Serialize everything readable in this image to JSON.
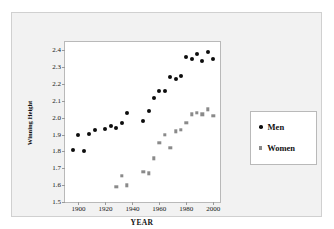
{
  "chart_data": {
    "type": "scatter",
    "title": "",
    "xlabel": "YEAR",
    "ylabel": "Winning Height",
    "xlim": [
      1890,
      2005
    ],
    "ylim": [
      1.5,
      2.45
    ],
    "xticks": [
      1900,
      1920,
      1940,
      1960,
      1980,
      2000
    ],
    "yticks": [
      "1.5",
      "1.6",
      "1.7",
      "1.8",
      "1.9",
      "2.0",
      "2.1",
      "2.2",
      "2.3",
      "2.4"
    ],
    "grid": false,
    "legend_position": "right",
    "series": [
      {
        "name": "Men",
        "marker": "circle",
        "color": "#0d0d0d",
        "points": [
          [
            1896,
            1.81
          ],
          [
            1900,
            1.9
          ],
          [
            1904,
            1.8
          ],
          [
            1908,
            1.905
          ],
          [
            1912,
            1.93
          ],
          [
            1920,
            1.935
          ],
          [
            1924,
            1.95
          ],
          [
            1928,
            1.94
          ],
          [
            1932,
            1.97
          ],
          [
            1936,
            2.03
          ],
          [
            1948,
            1.98
          ],
          [
            1952,
            2.04
          ],
          [
            1956,
            2.12
          ],
          [
            1960,
            2.16
          ],
          [
            1964,
            2.16
          ],
          [
            1968,
            2.24
          ],
          [
            1972,
            2.23
          ],
          [
            1976,
            2.25
          ],
          [
            1980,
            2.36
          ],
          [
            1984,
            2.35
          ],
          [
            1988,
            2.38
          ],
          [
            1992,
            2.34
          ],
          [
            1996,
            2.39
          ],
          [
            2000,
            2.35
          ]
        ]
      },
      {
        "name": "Women",
        "marker": "square",
        "color": "#8a8a8a",
        "points": [
          [
            1928,
            1.59
          ],
          [
            1932,
            1.657
          ],
          [
            1936,
            1.6
          ],
          [
            1948,
            1.68
          ],
          [
            1952,
            1.67
          ],
          [
            1956,
            1.76
          ],
          [
            1960,
            1.85
          ],
          [
            1964,
            1.9
          ],
          [
            1968,
            1.82
          ],
          [
            1972,
            1.92
          ],
          [
            1976,
            1.93
          ],
          [
            1980,
            1.97
          ],
          [
            1984,
            2.02
          ],
          [
            1988,
            2.03
          ],
          [
            1992,
            2.02
          ],
          [
            1996,
            2.05
          ],
          [
            2000,
            2.01
          ]
        ]
      }
    ]
  },
  "legend": {
    "entries": [
      {
        "label": "Men"
      },
      {
        "label": "Women"
      }
    ]
  }
}
